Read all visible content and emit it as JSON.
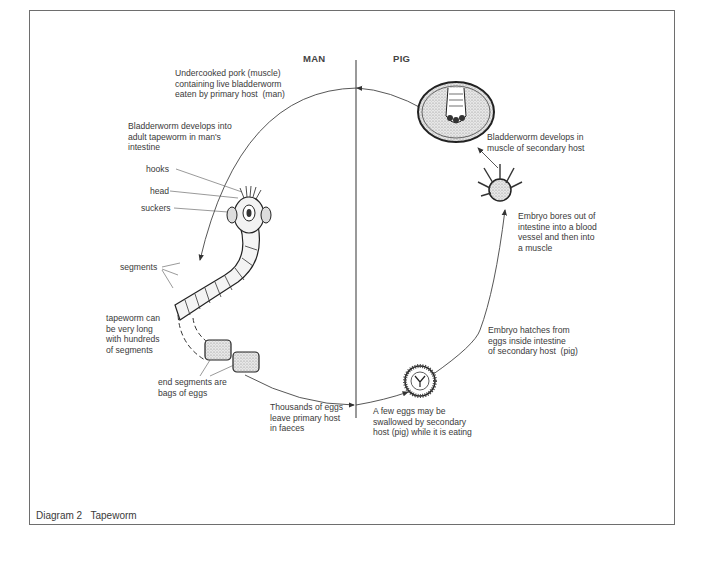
{
  "diagram": {
    "caption_number": "Diagram 2",
    "caption_title": "Tapeworm",
    "columns": {
      "left": "MAN",
      "right": "PIG"
    },
    "stages": [
      {
        "id": "eaten",
        "text": "Undercooked pork (muscle)\ncontaining live bladderworm\neaten by primary host  (man)"
      },
      {
        "id": "develops_adult",
        "text": "Bladderworm develops into\nadult tapeworm in man's\nintestine"
      },
      {
        "id": "eggs_leave",
        "text": "Thousands of eggs\nleave primary host\nin faeces"
      },
      {
        "id": "eggs_swallowed",
        "text": "A few eggs may be\nswallowed by secondary\nhost (pig) while it is eating"
      },
      {
        "id": "embryo_hatches",
        "text": "Embryo hatches from\neggs inside intestine\nof secondary host  (pig)"
      },
      {
        "id": "embryo_bores",
        "text": "Embryo bores out of\nintestine into a blood\nvessel and then into\na muscle"
      },
      {
        "id": "bladderworm_muscle",
        "text": "Bladderworm develops in\nmuscle of secondary host"
      }
    ],
    "parts": {
      "hooks": "hooks",
      "head": "head",
      "suckers": "suckers",
      "segments": "segments",
      "long_note": "tapeworm can\nbe very long\nwith hundreds\nof segments",
      "end_segments": "end segments are\nbags of eggs"
    }
  }
}
